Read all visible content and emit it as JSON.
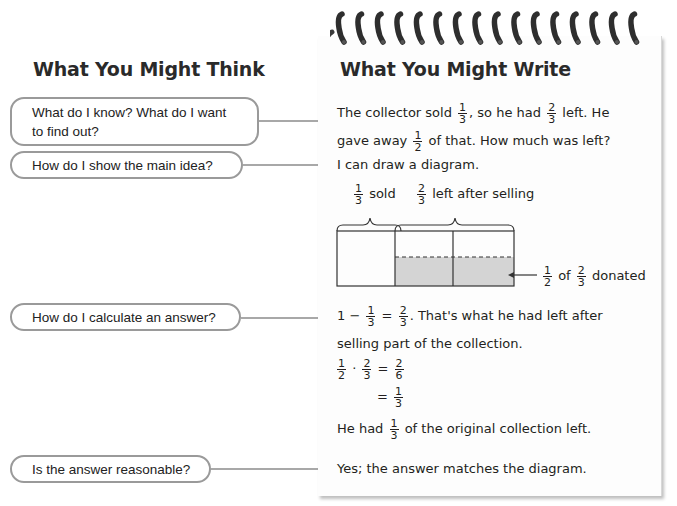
{
  "left": {
    "title": "What You Might Think",
    "questions": [
      {
        "line1": "What do I know? What do I want",
        "line2": "to find out?"
      },
      {
        "line1": "How do I show the main idea?"
      },
      {
        "line1": "How do I calculate an answer?"
      },
      {
        "line1": "Is the answer reasonable?"
      }
    ]
  },
  "right": {
    "title": "What You Might Write",
    "p1": {
      "a": "The collector sold",
      "f1": {
        "num": "1",
        "den": "3"
      },
      "b": ", so he had",
      "f2": {
        "num": "2",
        "den": "3"
      },
      "c": "left. He",
      "d": "gave away",
      "f3": {
        "num": "1",
        "den": "2"
      },
      "e": "of that. How much was left?"
    },
    "p2": "I can draw a diagram.",
    "diagram": {
      "label_sold_frac": {
        "num": "1",
        "den": "3"
      },
      "label_sold": "sold",
      "label_left_frac": {
        "num": "2",
        "den": "3"
      },
      "label_left": "left after selling",
      "donated_frac1": {
        "num": "1",
        "den": "2"
      },
      "donated_of": "of",
      "donated_frac2": {
        "num": "2",
        "den": "3"
      },
      "donated_label": "donated",
      "shade_color": "#d4d4d4"
    },
    "p3": {
      "a": "1 −",
      "f1": {
        "num": "1",
        "den": "3"
      },
      "eq": "=",
      "f2": {
        "num": "2",
        "den": "3"
      },
      "b": ". That's what he had left after",
      "c": "selling part of the collection."
    },
    "calc": {
      "f1": {
        "num": "1",
        "den": "2"
      },
      "dot": "·",
      "f2": {
        "num": "2",
        "den": "3"
      },
      "eq": "=",
      "f3": {
        "num": "2",
        "den": "6"
      },
      "eq2": "=",
      "f4": {
        "num": "1",
        "den": "3"
      }
    },
    "p4": {
      "a": "He had",
      "f1": {
        "num": "1",
        "den": "3"
      },
      "b": "of the original collection left."
    },
    "p5": "Yes; the answer matches the diagram."
  },
  "colors": {
    "bubble_border": "#9a9a9a",
    "arrow": "#a8a8a8",
    "text": "#231f20"
  }
}
